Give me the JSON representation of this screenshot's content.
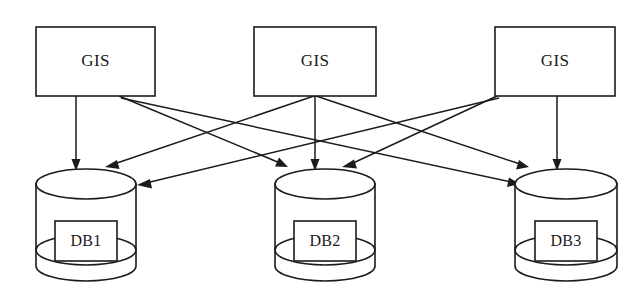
{
  "diagram": {
    "type": "node-link-diagram",
    "background_color": "#ffffff",
    "stroke_color": "#1b1b1b",
    "sources": [
      {
        "id": "gis1",
        "label": "GIS",
        "shape": "rectangle",
        "x": 36,
        "y": 27,
        "width": 119,
        "height": 69
      },
      {
        "id": "gis2",
        "label": "GIS",
        "shape": "rectangle",
        "x": 254,
        "y": 27,
        "width": 122,
        "height": 69
      },
      {
        "id": "gis3",
        "label": "GIS",
        "shape": "rectangle",
        "x": 495,
        "y": 27,
        "width": 120,
        "height": 69
      }
    ],
    "stores": [
      {
        "id": "db1",
        "label": "DB1",
        "shape": "cylinder",
        "cx": 86,
        "top_y": 184,
        "rx": 50,
        "ry": 15,
        "body_height": 82
      },
      {
        "id": "db2",
        "label": "DB2",
        "shape": "cylinder",
        "cx": 325,
        "top_y": 184,
        "rx": 50,
        "ry": 15,
        "body_height": 82
      },
      {
        "id": "db3",
        "label": "DB3",
        "shape": "cylinder",
        "cx": 566,
        "top_y": 184,
        "rx": 51,
        "ry": 15,
        "body_height": 82
      }
    ],
    "edges": [
      {
        "id": "e1",
        "from": "gis1",
        "to": "db1",
        "style": "straight-arrow"
      },
      {
        "id": "e2",
        "from": "gis1",
        "to": "db2",
        "style": "straight-arrow"
      },
      {
        "id": "e3",
        "from": "gis1",
        "to": "db3",
        "style": "straight-arrow"
      },
      {
        "id": "e4",
        "from": "gis2",
        "to": "db1",
        "style": "straight-arrow"
      },
      {
        "id": "e5",
        "from": "gis2",
        "to": "db2",
        "style": "straight-arrow"
      },
      {
        "id": "e6",
        "from": "gis2",
        "to": "db3",
        "style": "straight-arrow"
      },
      {
        "id": "e7",
        "from": "gis3",
        "to": "db1",
        "style": "straight-arrow"
      },
      {
        "id": "e8",
        "from": "gis3",
        "to": "db2",
        "style": "straight-arrow"
      },
      {
        "id": "e9",
        "from": "gis3",
        "to": "db3",
        "style": "straight-arrow"
      }
    ]
  }
}
